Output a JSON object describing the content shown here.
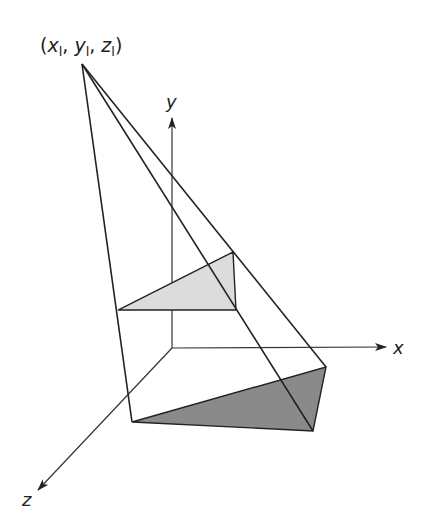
{
  "light_source": {
    "label_open": "(",
    "x_main": "x",
    "y_main": "y",
    "z_main": "z",
    "sub": "l",
    "sep": ", ",
    "label_close": ")",
    "position_px": [
      82,
      64
    ]
  },
  "axes": {
    "x_label": "x",
    "y_label": "y",
    "z_label": "z",
    "origin_px": [
      172,
      348
    ],
    "x_tip_px": [
      386,
      347
    ],
    "y_tip_px": [
      172,
      118
    ],
    "z_tip_px": [
      38,
      490
    ]
  },
  "polygon": {
    "name": "object triangle",
    "vertices_px": [
      [
        118,
        310
      ],
      [
        233,
        252
      ],
      [
        236,
        310
      ]
    ],
    "fill": "#dcdcdc"
  },
  "shadow": {
    "name": "projected shadow",
    "vertices_px": [
      [
        132,
        422
      ],
      [
        326,
        367
      ],
      [
        313,
        431
      ]
    ],
    "fill": "#8a8a8a"
  },
  "colors": {
    "line": "#222222",
    "axis": "#333333",
    "background": "#ffffff"
  }
}
